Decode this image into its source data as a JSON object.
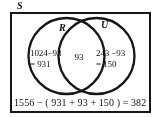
{
  "figure": {
    "type": "venn-diagram",
    "universal_set_label": "S",
    "sets": [
      {
        "name": "R",
        "label": "R",
        "region_lines": [
          "1024−93",
          "= 931"
        ],
        "total": 1024,
        "only": 931
      },
      {
        "name": "U",
        "label": "U",
        "region_lines": [
          "243 −93",
          "= 150"
        ],
        "total": 243,
        "only": 150
      }
    ],
    "intersection": {
      "label": "93",
      "value": 93
    },
    "equation": "1556 − ( 931 + 93 + 150 ) = 382",
    "universal_total": 1556,
    "outside_value": 382,
    "colors": {
      "ink": "#1b1b1b",
      "paper": "#fbfbf9"
    }
  }
}
